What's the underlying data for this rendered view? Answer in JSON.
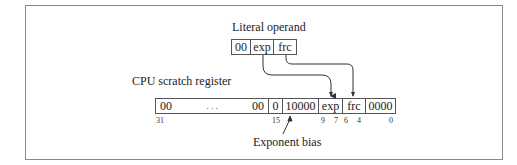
{
  "diagram": {
    "literal_operand": {
      "title": "Literal operand",
      "fields": [
        "00",
        "exp",
        "frc"
      ]
    },
    "cpu_register": {
      "title": "CPU scratch register",
      "fields": {
        "high_left": "00",
        "ellipsis": ". . .",
        "high_right": "00",
        "sign": "0",
        "bias": "10000",
        "exp": "exp",
        "frc": "frc",
        "low": "0000"
      },
      "bit_labels": [
        "31",
        "15",
        "9",
        "7",
        "6",
        "4",
        "0"
      ]
    },
    "annotation": "Exponent bias",
    "colors": {
      "line": "#333333",
      "frame": "#8a8a8a"
    }
  }
}
